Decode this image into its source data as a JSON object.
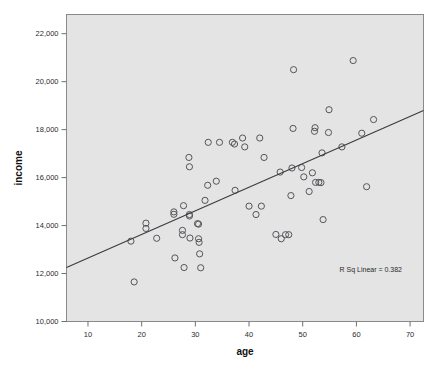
{
  "chart_data": {
    "type": "scatter",
    "title": "",
    "xlabel": "age",
    "ylabel": "income",
    "xlim": [
      6,
      72.5
    ],
    "ylim": [
      10000,
      22800
    ],
    "xticks": [
      10,
      20,
      30,
      40,
      50,
      60,
      70
    ],
    "xtick_labels": [
      "10",
      "20",
      "30",
      "40",
      "50",
      "60",
      "70"
    ],
    "yticks": [
      10000,
      12000,
      14000,
      16000,
      18000,
      20000,
      22000
    ],
    "ytick_labels": [
      "10,000",
      "12,000",
      "14,000",
      "16,000",
      "18,000",
      "20,000",
      "22,000"
    ],
    "grid": false,
    "legend": "none",
    "annotation": "R Sq Linear = 0.382",
    "r_squared": 0.382,
    "marker_style": "open-circle",
    "panel_color": "#e4e4e4",
    "marker_color": "#55555b",
    "line_color": "#3a3a40",
    "fit_line": {
      "type": "linear",
      "x_start": 6.0,
      "y_start": 12250,
      "x_end": 72.5,
      "y_end": 18800
    },
    "points": [
      {
        "x": 18.0,
        "y": 13350
      },
      {
        "x": 18.6,
        "y": 11650
      },
      {
        "x": 20.8,
        "y": 14100
      },
      {
        "x": 20.8,
        "y": 13880
      },
      {
        "x": 22.8,
        "y": 13470
      },
      {
        "x": 26.0,
        "y": 14570
      },
      {
        "x": 26.0,
        "y": 14470
      },
      {
        "x": 26.2,
        "y": 12650
      },
      {
        "x": 27.6,
        "y": 13800
      },
      {
        "x": 27.6,
        "y": 13620
      },
      {
        "x": 27.8,
        "y": 14830
      },
      {
        "x": 27.9,
        "y": 12250
      },
      {
        "x": 28.8,
        "y": 16840
      },
      {
        "x": 28.9,
        "y": 16450
      },
      {
        "x": 28.9,
        "y": 14460
      },
      {
        "x": 28.9,
        "y": 14400
      },
      {
        "x": 29.0,
        "y": 13480
      },
      {
        "x": 30.4,
        "y": 14080
      },
      {
        "x": 30.6,
        "y": 14060
      },
      {
        "x": 30.6,
        "y": 13450
      },
      {
        "x": 30.7,
        "y": 13300
      },
      {
        "x": 30.8,
        "y": 12820
      },
      {
        "x": 31.0,
        "y": 12240
      },
      {
        "x": 31.8,
        "y": 15050
      },
      {
        "x": 32.3,
        "y": 15680
      },
      {
        "x": 32.4,
        "y": 17470
      },
      {
        "x": 33.9,
        "y": 15850
      },
      {
        "x": 34.5,
        "y": 17470
      },
      {
        "x": 36.9,
        "y": 17470
      },
      {
        "x": 37.3,
        "y": 17400
      },
      {
        "x": 37.4,
        "y": 15470
      },
      {
        "x": 38.8,
        "y": 17650
      },
      {
        "x": 39.2,
        "y": 17280
      },
      {
        "x": 40.0,
        "y": 14810
      },
      {
        "x": 41.3,
        "y": 14460
      },
      {
        "x": 42.0,
        "y": 17650
      },
      {
        "x": 42.3,
        "y": 14810
      },
      {
        "x": 42.8,
        "y": 16840
      },
      {
        "x": 45.0,
        "y": 13630
      },
      {
        "x": 45.8,
        "y": 16230
      },
      {
        "x": 46.0,
        "y": 13450
      },
      {
        "x": 46.8,
        "y": 13620
      },
      {
        "x": 47.4,
        "y": 13620
      },
      {
        "x": 47.8,
        "y": 15250
      },
      {
        "x": 48.0,
        "y": 16400
      },
      {
        "x": 48.2,
        "y": 18050
      },
      {
        "x": 48.3,
        "y": 20500
      },
      {
        "x": 49.8,
        "y": 16420
      },
      {
        "x": 50.2,
        "y": 16030
      },
      {
        "x": 51.2,
        "y": 15420
      },
      {
        "x": 51.8,
        "y": 16200
      },
      {
        "x": 52.2,
        "y": 17930
      },
      {
        "x": 52.3,
        "y": 18080
      },
      {
        "x": 52.4,
        "y": 15800
      },
      {
        "x": 53.0,
        "y": 15800
      },
      {
        "x": 53.4,
        "y": 15790
      },
      {
        "x": 53.6,
        "y": 17030
      },
      {
        "x": 53.8,
        "y": 14250
      },
      {
        "x": 54.8,
        "y": 17880
      },
      {
        "x": 54.9,
        "y": 18830
      },
      {
        "x": 57.3,
        "y": 17280
      },
      {
        "x": 59.4,
        "y": 20880
      },
      {
        "x": 61.0,
        "y": 17850
      },
      {
        "x": 61.9,
        "y": 15620
      },
      {
        "x": 63.2,
        "y": 18420
      }
    ]
  }
}
